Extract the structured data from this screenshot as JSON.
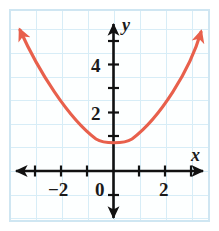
{
  "figure": {
    "kind": "coordinate-plane-graph",
    "border_color": "#cfe6f2",
    "grid_color": "#d7edf7",
    "axis_color": "#111111",
    "curve_color": "#e8604c",
    "background": "#ffffff"
  },
  "axes": {
    "x_label": "x",
    "y_label": "y",
    "origin_label": "0",
    "x_ticks": [
      {
        "value": -3,
        "label": ""
      },
      {
        "value": -2,
        "label": "−2"
      },
      {
        "value": -1,
        "label": ""
      },
      {
        "value": 0,
        "label": "0"
      },
      {
        "value": 1,
        "label": ""
      },
      {
        "value": 2,
        "label": "2"
      },
      {
        "value": 3,
        "label": ""
      }
    ],
    "y_ticks": [
      {
        "value": 1,
        "label": ""
      },
      {
        "value": 2,
        "label": "2"
      },
      {
        "value": 3,
        "label": ""
      },
      {
        "value": 4,
        "label": "4"
      },
      {
        "value": 5,
        "label": ""
      }
    ],
    "x_tick_labels": [
      "−2",
      "0",
      "2"
    ],
    "y_tick_labels": [
      "2",
      "4"
    ],
    "xlim": [
      -3.9,
      3.7
    ],
    "ylim": [
      -1.6,
      5.7
    ]
  },
  "chart_data": {
    "type": "line",
    "title": "",
    "xlabel": "x",
    "ylabel": "y",
    "grid": true,
    "legend": "none",
    "xlim": [
      -3.9,
      3.7
    ],
    "ylim": [
      -1.6,
      5.7
    ],
    "xticks": [
      -3,
      -2,
      -1,
      0,
      1,
      2,
      3
    ],
    "yticks": [
      1,
      2,
      3,
      4,
      5
    ],
    "xticklabels": [
      "",
      "−2",
      "",
      "0",
      "",
      "2",
      ""
    ],
    "yticklabels": [
      "",
      "2",
      "",
      "4",
      ""
    ],
    "series": [
      {
        "name": "parabola",
        "color": "#e8604c",
        "equation": "y = 0.5(x - 0.25)^2 + 1",
        "vertex": [
          0.25,
          1
        ],
        "arrows": "both-ends",
        "x": [
          -3.85,
          -3.5,
          -3.0,
          -2.5,
          -2.0,
          -1.5,
          -1.0,
          -0.5,
          0.0,
          0.25,
          0.5,
          1.0,
          1.5,
          2.0,
          2.5,
          3.0,
          3.4
        ],
        "y": [
          9.4,
          8.0,
          6.3,
          4.8,
          3.5,
          2.5,
          1.8,
          1.3,
          1.03,
          1.0,
          1.03,
          1.3,
          1.8,
          2.5,
          3.5,
          4.8,
          6.0
        ]
      }
    ]
  }
}
